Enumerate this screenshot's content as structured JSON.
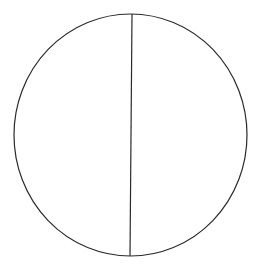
{
  "diagram": {
    "type": "circle-divided-by-vertical-line",
    "canvas": {
      "width": 262,
      "height": 266,
      "background": "#ffffff"
    },
    "circle": {
      "cx": 130.5,
      "cy": 135,
      "rx": 116.5,
      "ry": 121,
      "stroke": "#2a2a2a",
      "stroke_width": 1.2,
      "fill": "none"
    },
    "divider": {
      "x1": 132,
      "y1": 14,
      "x2": 130,
      "y2": 256,
      "stroke": "#2a2a2a",
      "stroke_width": 1.2
    },
    "regions": [
      {
        "name": "left-half"
      },
      {
        "name": "right-half"
      }
    ]
  }
}
